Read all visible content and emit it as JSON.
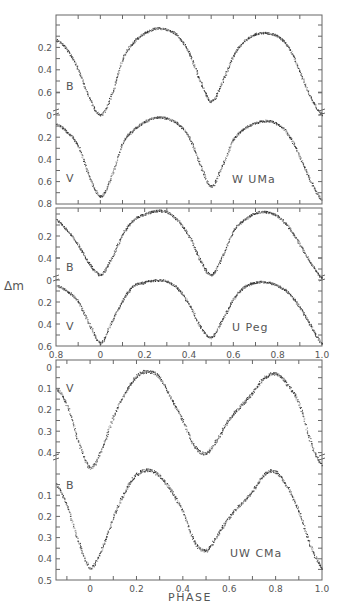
{
  "figure": {
    "ylabel": "Δm",
    "xlabel": "PHASE"
  },
  "chart_data": [
    {
      "type": "scatter",
      "title": "W UMa",
      "star_label": "W UMa",
      "xlabel": "",
      "ylabel": "Δm",
      "xlim": [
        -0.2,
        1.0
      ],
      "x_tick_labels": [],
      "grid": false,
      "series": [
        {
          "name": "B",
          "ylim": [
            -0.05,
            0.8
          ],
          "y_tick_labels": [
            "0.2",
            "0.4",
            "0.6"
          ],
          "y_ticks": [
            0.2,
            0.4,
            0.6
          ],
          "phase": [
            -0.2,
            -0.15,
            -0.1,
            -0.05,
            0,
            0.05,
            0.1,
            0.15,
            0.2,
            0.25,
            0.3,
            0.35,
            0.4,
            0.45,
            0.5,
            0.55,
            0.6,
            0.65,
            0.7,
            0.75,
            0.8,
            0.85,
            0.9,
            0.95,
            1.0
          ],
          "dm": [
            0.13,
            0.22,
            0.4,
            0.65,
            0.8,
            0.62,
            0.3,
            0.15,
            0.07,
            0.03,
            0.04,
            0.1,
            0.25,
            0.5,
            0.68,
            0.5,
            0.27,
            0.14,
            0.08,
            0.07,
            0.1,
            0.2,
            0.42,
            0.65,
            0.8
          ]
        },
        {
          "name": "V",
          "ylim": [
            0,
            0.8
          ],
          "y_tick_labels": [
            "0",
            "0.2",
            "0.4",
            "0.6",
            "0.8"
          ],
          "y_ticks": [
            0,
            0.2,
            0.4,
            0.6,
            0.8
          ],
          "phase": [
            -0.2,
            -0.15,
            -0.1,
            -0.05,
            0,
            0.05,
            0.1,
            0.15,
            0.2,
            0.25,
            0.3,
            0.35,
            0.4,
            0.45,
            0.5,
            0.55,
            0.6,
            0.65,
            0.7,
            0.75,
            0.8,
            0.85,
            0.9,
            0.95,
            1.0
          ],
          "dm": [
            0.08,
            0.15,
            0.28,
            0.55,
            0.73,
            0.55,
            0.25,
            0.13,
            0.06,
            0.02,
            0.03,
            0.08,
            0.2,
            0.45,
            0.64,
            0.45,
            0.22,
            0.12,
            0.07,
            0.05,
            0.08,
            0.18,
            0.38,
            0.6,
            0.77
          ]
        }
      ]
    },
    {
      "type": "scatter",
      "title": "U Peg",
      "star_label": "U Peg",
      "xlabel": "",
      "ylabel": "Δm",
      "xlim": [
        -0.2,
        1.0
      ],
      "x_tick_labels": [
        "0.8",
        "0",
        "0.2",
        "0.4",
        "0.6",
        "0.8",
        "1.0"
      ],
      "x_tick_values": [
        -0.2,
        0,
        0.2,
        0.4,
        0.6,
        0.8,
        1.0
      ],
      "grid": false,
      "series": [
        {
          "name": "B",
          "ylim": [
            -0.05,
            0.6
          ],
          "y_tick_labels": [
            "0.2",
            "0.4"
          ],
          "y_ticks": [
            0.2,
            0.4
          ],
          "phase": [
            -0.2,
            -0.15,
            -0.1,
            -0.05,
            0,
            0.05,
            0.1,
            0.15,
            0.2,
            0.25,
            0.3,
            0.35,
            0.4,
            0.45,
            0.5,
            0.55,
            0.6,
            0.65,
            0.7,
            0.75,
            0.8,
            0.85,
            0.9,
            0.95,
            1.0
          ],
          "dm": [
            0.05,
            0.15,
            0.28,
            0.45,
            0.55,
            0.4,
            0.18,
            0.05,
            0.0,
            -0.03,
            -0.02,
            0.06,
            0.2,
            0.42,
            0.55,
            0.38,
            0.15,
            0.05,
            -0.01,
            -0.02,
            0.02,
            0.12,
            0.28,
            0.45,
            0.58
          ]
        },
        {
          "name": "V",
          "ylim": [
            0,
            0.6
          ],
          "y_tick_labels": [
            "0",
            "0.2",
            "0.4",
            "0.6"
          ],
          "y_ticks": [
            0,
            0.2,
            0.4,
            0.6
          ],
          "phase": [
            -0.2,
            -0.15,
            -0.1,
            -0.05,
            0,
            0.05,
            0.1,
            0.15,
            0.2,
            0.25,
            0.3,
            0.35,
            0.4,
            0.45,
            0.5,
            0.55,
            0.6,
            0.65,
            0.7,
            0.75,
            0.8,
            0.85,
            0.9,
            0.95,
            1.0
          ],
          "dm": [
            0.05,
            0.1,
            0.2,
            0.4,
            0.57,
            0.38,
            0.18,
            0.05,
            0.02,
            0.0,
            0.01,
            0.08,
            0.22,
            0.42,
            0.52,
            0.36,
            0.17,
            0.06,
            0.02,
            0.02,
            0.05,
            0.12,
            0.25,
            0.42,
            0.58
          ]
        }
      ]
    },
    {
      "type": "scatter",
      "title": "UW CMa",
      "star_label": "UW CMa",
      "xlabel": "PHASE",
      "ylabel": "Δm",
      "xlim": [
        -0.147,
        1.0
      ],
      "x_tick_labels": [
        "0",
        "0.2",
        "0.4",
        "0.6",
        "0.8",
        "1.0"
      ],
      "x_tick_values": [
        0,
        0.2,
        0.4,
        0.6,
        0.8,
        1.0
      ],
      "grid": false,
      "series": [
        {
          "name": "V",
          "ylim": [
            -0.03,
            0.5
          ],
          "y_tick_labels": [
            "0",
            "0.1",
            "0.2",
            "0.3",
            "0.4"
          ],
          "y_ticks": [
            0,
            0.1,
            0.2,
            0.3,
            0.4
          ],
          "phase": [
            -0.147,
            -0.1,
            -0.05,
            0,
            0.05,
            0.1,
            0.15,
            0.2,
            0.25,
            0.3,
            0.35,
            0.4,
            0.45,
            0.5,
            0.55,
            0.6,
            0.65,
            0.7,
            0.75,
            0.8,
            0.85,
            0.9,
            0.95,
            1.0
          ],
          "dm": [
            0.1,
            0.18,
            0.35,
            0.47,
            0.38,
            0.23,
            0.12,
            0.04,
            0.02,
            0.05,
            0.15,
            0.25,
            0.37,
            0.4,
            0.33,
            0.24,
            0.18,
            0.12,
            0.05,
            0.03,
            0.08,
            0.17,
            0.35,
            0.46
          ]
        },
        {
          "name": "B",
          "ylim": [
            0,
            0.5
          ],
          "y_tick_labels": [
            "0.1",
            "0.2",
            "0.3",
            "0.4",
            "0.5"
          ],
          "y_ticks": [
            0.1,
            0.2,
            0.3,
            0.4,
            0.5
          ],
          "phase": [
            -0.147,
            -0.1,
            -0.05,
            0,
            0.05,
            0.1,
            0.15,
            0.2,
            0.25,
            0.3,
            0.35,
            0.4,
            0.45,
            0.5,
            0.55,
            0.6,
            0.65,
            0.7,
            0.75,
            0.8,
            0.85,
            0.9,
            0.95,
            1.0
          ],
          "dm": [
            0.05,
            0.15,
            0.32,
            0.44,
            0.35,
            0.2,
            0.08,
            0.0,
            -0.02,
            0.01,
            0.08,
            0.18,
            0.32,
            0.36,
            0.28,
            0.2,
            0.14,
            0.08,
            0.0,
            -0.01,
            0.06,
            0.18,
            0.34,
            0.44
          ]
        }
      ]
    }
  ]
}
